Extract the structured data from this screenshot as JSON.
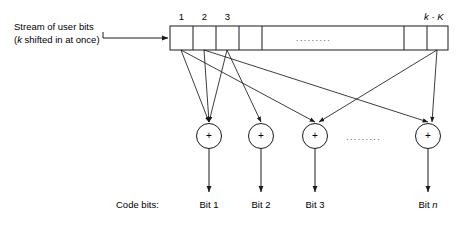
{
  "figure": {
    "background_color": "#ffffff",
    "line_color": "#1a1a1a",
    "text_color": "#000000"
  },
  "input_label": {
    "line1": "Stream of user bits",
    "line2_prefix": "(",
    "line2_italic": "k",
    "line2_suffix": " shifted in at once)"
  },
  "register": {
    "name": "shift-register",
    "cell_indices": [
      "1",
      "2",
      "3"
    ],
    "last_cell_label_part1": "k",
    "last_cell_label_dot": " · ",
    "last_cell_label_part2": "K",
    "interior_ellipsis": "........."
  },
  "adders": {
    "symbol": "+",
    "count": 4,
    "ellipsis": "........."
  },
  "outputs": {
    "section_label": "Code bits:",
    "items": [
      {
        "text": "Bit 1",
        "italic_part": ""
      },
      {
        "text": "Bit 2",
        "italic_part": ""
      },
      {
        "text": "Bit 3",
        "italic_part": ""
      },
      {
        "text_prefix": "Bit ",
        "italic_part": "n"
      }
    ]
  }
}
